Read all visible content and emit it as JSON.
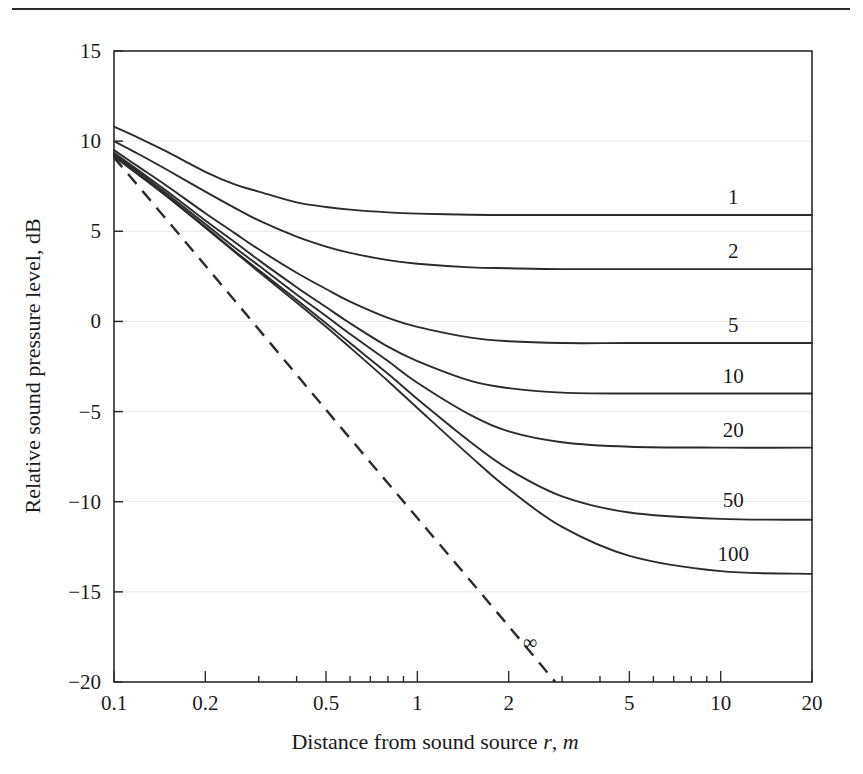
{
  "figure": {
    "has_top_rule": true,
    "background_color": "#ffffff",
    "line_color": "#2b2b2b",
    "grid_color": "#e8e8e8"
  },
  "chart_data": {
    "type": "line",
    "title": "",
    "xlabel": "Distance from sound source r, m",
    "xlabel_parts": {
      "text": "Distance from sound source ",
      "var1": "r",
      "sep": ", ",
      "var2": "m"
    },
    "ylabel": "Relative sound pressure level, dB",
    "xscale": "log",
    "xlim": [
      0.1,
      20
    ],
    "ylim": [
      -20,
      15
    ],
    "xticks": [
      0.1,
      0.2,
      0.5,
      1,
      2,
      5,
      10,
      20
    ],
    "xticklabels": [
      "0.1",
      "0.2",
      "0.5",
      "1",
      "2",
      "5",
      "10",
      "20"
    ],
    "yticks": [
      15,
      10,
      5,
      0,
      -5,
      -10,
      -15,
      -20
    ],
    "yticklabels": [
      "15",
      "10",
      "5",
      "0",
      "−5",
      "−10",
      "−15",
      "−20"
    ],
    "grid": "faint-horizontal-major",
    "legend": "inline-right-labels",
    "series_label_key": "Room constant R",
    "series": [
      {
        "name": "1",
        "label": "1",
        "style": "solid",
        "plateau_db": 5.9,
        "label_x": 11.0,
        "label_y": 6.9,
        "points": [
          [
            0.1,
            10.8
          ],
          [
            0.12,
            10.2
          ],
          [
            0.15,
            9.4
          ],
          [
            0.2,
            8.3
          ],
          [
            0.25,
            7.6
          ],
          [
            0.3,
            7.2
          ],
          [
            0.4,
            6.6
          ],
          [
            0.5,
            6.35
          ],
          [
            0.6,
            6.2
          ],
          [
            0.8,
            6.05
          ],
          [
            1.0,
            5.98
          ],
          [
            1.5,
            5.92
          ],
          [
            2.0,
            5.9
          ],
          [
            3.0,
            5.9
          ],
          [
            5.0,
            5.9
          ],
          [
            10.0,
            5.9
          ],
          [
            20.0,
            5.9
          ]
        ]
      },
      {
        "name": "2",
        "label": "2",
        "style": "solid",
        "plateau_db": 2.9,
        "label_x": 11.0,
        "label_y": 3.9,
        "points": [
          [
            0.1,
            10.0
          ],
          [
            0.12,
            9.3
          ],
          [
            0.15,
            8.4
          ],
          [
            0.2,
            7.2
          ],
          [
            0.25,
            6.3
          ],
          [
            0.3,
            5.6
          ],
          [
            0.4,
            4.7
          ],
          [
            0.5,
            4.15
          ],
          [
            0.6,
            3.8
          ],
          [
            0.8,
            3.4
          ],
          [
            1.0,
            3.2
          ],
          [
            1.5,
            3.0
          ],
          [
            2.0,
            2.95
          ],
          [
            3.0,
            2.9
          ],
          [
            5.0,
            2.9
          ],
          [
            10.0,
            2.9
          ],
          [
            20.0,
            2.9
          ]
        ]
      },
      {
        "name": "5",
        "label": "5",
        "style": "solid",
        "plateau_db": -1.2,
        "label_x": 11.0,
        "label_y": -0.2,
        "points": [
          [
            0.1,
            9.5
          ],
          [
            0.12,
            8.6
          ],
          [
            0.15,
            7.5
          ],
          [
            0.2,
            6.0
          ],
          [
            0.25,
            4.9
          ],
          [
            0.3,
            4.0
          ],
          [
            0.4,
            2.7
          ],
          [
            0.5,
            1.8
          ],
          [
            0.6,
            1.1
          ],
          [
            0.8,
            0.2
          ],
          [
            1.0,
            -0.3
          ],
          [
            1.5,
            -0.9
          ],
          [
            2.0,
            -1.1
          ],
          [
            3.0,
            -1.2
          ],
          [
            5.0,
            -1.2
          ],
          [
            10.0,
            -1.2
          ],
          [
            20.0,
            -1.2
          ]
        ]
      },
      {
        "name": "10",
        "label": "10",
        "style": "solid",
        "plateau_db": -4.0,
        "label_x": 11.0,
        "label_y": -3.0,
        "points": [
          [
            0.1,
            9.35
          ],
          [
            0.12,
            8.4
          ],
          [
            0.15,
            7.2
          ],
          [
            0.2,
            5.6
          ],
          [
            0.25,
            4.4
          ],
          [
            0.3,
            3.4
          ],
          [
            0.4,
            1.9
          ],
          [
            0.5,
            0.8
          ],
          [
            0.6,
            -0.1
          ],
          [
            0.8,
            -1.4
          ],
          [
            1.0,
            -2.2
          ],
          [
            1.5,
            -3.3
          ],
          [
            2.0,
            -3.7
          ],
          [
            3.0,
            -3.95
          ],
          [
            5.0,
            -4.0
          ],
          [
            10.0,
            -4.0
          ],
          [
            20.0,
            -4.0
          ]
        ]
      },
      {
        "name": "20",
        "label": "20",
        "style": "solid",
        "plateau_db": -7.0,
        "label_x": 11.0,
        "label_y": -6.0,
        "points": [
          [
            0.1,
            9.25
          ],
          [
            0.12,
            8.3
          ],
          [
            0.15,
            7.05
          ],
          [
            0.2,
            5.4
          ],
          [
            0.25,
            4.1
          ],
          [
            0.3,
            3.1
          ],
          [
            0.4,
            1.5
          ],
          [
            0.5,
            0.3
          ],
          [
            0.6,
            -0.7
          ],
          [
            0.8,
            -2.2
          ],
          [
            1.0,
            -3.4
          ],
          [
            1.5,
            -5.2
          ],
          [
            2.0,
            -6.1
          ],
          [
            3.0,
            -6.7
          ],
          [
            5.0,
            -6.95
          ],
          [
            10.0,
            -7.0
          ],
          [
            20.0,
            -7.0
          ]
        ]
      },
      {
        "name": "50",
        "label": "50",
        "style": "solid",
        "plateau_db": -11.0,
        "label_x": 11.0,
        "label_y": -9.9,
        "points": [
          [
            0.1,
            9.2
          ],
          [
            0.12,
            8.2
          ],
          [
            0.15,
            6.95
          ],
          [
            0.2,
            5.25
          ],
          [
            0.25,
            3.9
          ],
          [
            0.3,
            2.85
          ],
          [
            0.4,
            1.2
          ],
          [
            0.5,
            -0.1
          ],
          [
            0.6,
            -1.2
          ],
          [
            0.8,
            -2.9
          ],
          [
            1.0,
            -4.3
          ],
          [
            1.5,
            -6.7
          ],
          [
            2.0,
            -8.2
          ],
          [
            3.0,
            -9.7
          ],
          [
            5.0,
            -10.6
          ],
          [
            10.0,
            -10.95
          ],
          [
            20.0,
            -11.0
          ]
        ]
      },
      {
        "name": "100",
        "label": "100",
        "style": "solid",
        "plateau_db": -14.0,
        "label_x": 11.0,
        "label_y": -12.9,
        "points": [
          [
            0.1,
            9.15
          ],
          [
            0.12,
            8.15
          ],
          [
            0.15,
            6.9
          ],
          [
            0.2,
            5.2
          ],
          [
            0.25,
            3.85
          ],
          [
            0.3,
            2.75
          ],
          [
            0.4,
            1.05
          ],
          [
            0.5,
            -0.3
          ],
          [
            0.6,
            -1.45
          ],
          [
            0.8,
            -3.3
          ],
          [
            1.0,
            -4.8
          ],
          [
            1.5,
            -7.5
          ],
          [
            2.0,
            -9.3
          ],
          [
            3.0,
            -11.4
          ],
          [
            5.0,
            -13.0
          ],
          [
            10.0,
            -13.85
          ],
          [
            20.0,
            -14.0
          ]
        ]
      }
    ],
    "reference_line": {
      "name": "infinity",
      "label": "∞",
      "style": "dashed",
      "description": "free field, inverse square law",
      "label_x": 2.35,
      "label_y": -17.8,
      "points": [
        [
          0.1,
          9.1
        ],
        [
          0.2,
          3.1
        ],
        [
          0.5,
          -4.9
        ],
        [
          1.0,
          -10.9
        ],
        [
          2.0,
          -16.9
        ],
        [
          2.85,
          -20.0
        ]
      ]
    }
  }
}
